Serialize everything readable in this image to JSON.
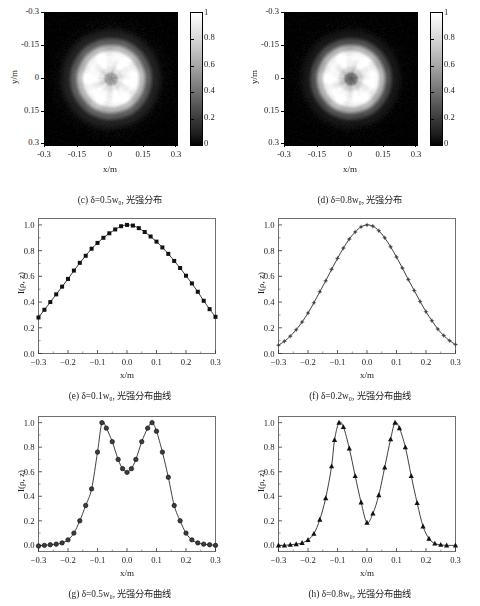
{
  "figure": {
    "colormap": "grayscale",
    "accent": "#000000",
    "frame_color": "#6f6f6f"
  },
  "axes_common": {
    "image_xlabel": "x/m",
    "image_ylabel": "y/m",
    "image_xticks": [
      "-0.3",
      "-0.15",
      "0",
      "0.15",
      "0.3"
    ],
    "image_yticks": [
      "-0.3",
      "-0.15",
      "0",
      "0.15",
      "0.3"
    ],
    "colorbar_ticks": [
      "0",
      "0.2",
      "0.4",
      "0.6",
      "0.8",
      "1"
    ],
    "plot_xlabel": "x/m",
    "plot_ylabel": "I(ρ, z)",
    "plot_xticks": [
      "-0.3",
      "-0.2",
      "-0.1",
      "0.0",
      "0.1",
      "0.2",
      "0.3"
    ],
    "plot_yticks": [
      "0.0",
      "0.2",
      "0.4",
      "0.6",
      "0.8",
      "1.0"
    ]
  },
  "panels": [
    {
      "id": "c",
      "caption": "(c) δ=0.5w₀, 光强分布",
      "kind": "image"
    },
    {
      "id": "d",
      "caption": "(d) δ=0.8w₀, 光强分布",
      "kind": "image"
    },
    {
      "id": "e",
      "caption": "(e) δ=0.1w₀, 光强分布曲线",
      "kind": "plot"
    },
    {
      "id": "f",
      "caption": "(f) δ=0.2w₀, 光强分布曲线",
      "kind": "plot"
    },
    {
      "id": "g",
      "caption": "(g) δ=0.5w₀, 光强分布曲线",
      "kind": "plot"
    },
    {
      "id": "h",
      "caption": "(h) δ=0.8w₀, 光强分布曲线",
      "kind": "plot"
    }
  ],
  "chart_data": [
    {
      "id": "c",
      "type": "heatmap",
      "title": "(c) δ=0.5w₀, 光强分布",
      "xlabel": "x/m",
      "ylabel": "y/m",
      "xlim": [
        -0.3,
        0.3
      ],
      "ylim": [
        -0.3,
        0.3
      ],
      "xticks": [
        -0.3,
        -0.15,
        0,
        0.15,
        0.3
      ],
      "yticks": [
        -0.3,
        -0.15,
        0,
        0.15,
        0.3
      ],
      "colormap": "gray",
      "clim": [
        0,
        1
      ],
      "colorbar_ticks": [
        0,
        0.2,
        0.4,
        0.6,
        0.8,
        1
      ],
      "description": "Near-flat-top circular beam spot, bright disc radius ~0.115 m with a small dark core at the centre (r~0.02 m) and a soft Gaussian fall-off to black background.",
      "profile_radius_m": [
        0.0,
        0.02,
        0.04,
        0.07,
        0.1,
        0.115,
        0.14,
        0.17,
        0.2,
        0.25,
        0.3
      ],
      "profile_intensity": [
        0.55,
        0.62,
        0.88,
        0.97,
        1.0,
        0.97,
        0.72,
        0.36,
        0.13,
        0.02,
        0.0
      ]
    },
    {
      "id": "d",
      "type": "heatmap",
      "title": "(d) δ=0.8w₀, 光强分布",
      "xlabel": "x/m",
      "ylabel": "y/m",
      "xlim": [
        -0.3,
        0.3
      ],
      "ylim": [
        -0.3,
        0.3
      ],
      "xticks": [
        -0.3,
        -0.15,
        0,
        0.15,
        0.3
      ],
      "yticks": [
        -0.3,
        -0.15,
        0,
        0.15,
        0.3
      ],
      "colormap": "gray",
      "clim": [
        0,
        1
      ],
      "colorbar_ticks": [
        0,
        0.2,
        0.4,
        0.6,
        0.8,
        1
      ],
      "description": "Annular (doughnut) beam spot: bright ring peaking at r~0.10 m with a clearly darker central core and sharper outer edge than panel (c).",
      "profile_radius_m": [
        0.0,
        0.02,
        0.04,
        0.07,
        0.1,
        0.115,
        0.14,
        0.17,
        0.2,
        0.25,
        0.3
      ],
      "profile_intensity": [
        0.35,
        0.45,
        0.8,
        0.96,
        1.0,
        0.96,
        0.7,
        0.3,
        0.09,
        0.01,
        0.0
      ]
    },
    {
      "id": "e",
      "type": "line",
      "title": "(e) δ=0.1w₀, 光强分布曲线",
      "xlabel": "x/m",
      "ylabel": "I(ρ, z)",
      "xlim": [
        -0.3,
        0.3
      ],
      "ylim": [
        0.0,
        1.05
      ],
      "xticks": [
        -0.3,
        -0.2,
        -0.1,
        0.0,
        0.1,
        0.2,
        0.3
      ],
      "yticks": [
        0.0,
        0.2,
        0.4,
        0.6,
        0.8,
        1.0
      ],
      "marker": "filled-square",
      "series": [
        {
          "name": "I(ρ, z)",
          "x": [
            -0.3,
            -0.28,
            -0.26,
            -0.24,
            -0.22,
            -0.2,
            -0.18,
            -0.16,
            -0.14,
            -0.12,
            -0.1,
            -0.08,
            -0.06,
            -0.04,
            -0.02,
            0.0,
            0.02,
            0.04,
            0.06,
            0.08,
            0.1,
            0.12,
            0.14,
            0.16,
            0.18,
            0.2,
            0.22,
            0.24,
            0.26,
            0.28,
            0.3
          ],
          "values": [
            0.28,
            0.34,
            0.4,
            0.46,
            0.52,
            0.58,
            0.645,
            0.705,
            0.76,
            0.815,
            0.86,
            0.9,
            0.935,
            0.965,
            0.99,
            1.0,
            0.995,
            0.975,
            0.945,
            0.91,
            0.87,
            0.825,
            0.775,
            0.72,
            0.665,
            0.605,
            0.545,
            0.48,
            0.41,
            0.345,
            0.285
          ]
        }
      ]
    },
    {
      "id": "f",
      "type": "line",
      "title": "(f) δ=0.2w₀, 光强分布曲线",
      "xlabel": "x/m",
      "ylabel": "I(ρ, z)",
      "xlim": [
        -0.3,
        0.3
      ],
      "ylim": [
        0.0,
        1.05
      ],
      "xticks": [
        -0.3,
        -0.2,
        -0.1,
        0.0,
        0.1,
        0.2,
        0.3
      ],
      "yticks": [
        0.0,
        0.2,
        0.4,
        0.6,
        0.8,
        1.0
      ],
      "marker": "small-star",
      "series": [
        {
          "name": "I(ρ, z)",
          "x": [
            -0.3,
            -0.28,
            -0.26,
            -0.24,
            -0.22,
            -0.2,
            -0.18,
            -0.16,
            -0.14,
            -0.12,
            -0.1,
            -0.08,
            -0.06,
            -0.04,
            -0.02,
            0.0,
            0.02,
            0.04,
            0.06,
            0.08,
            0.1,
            0.12,
            0.14,
            0.16,
            0.18,
            0.2,
            0.22,
            0.24,
            0.26,
            0.28,
            0.3
          ],
          "values": [
            0.065,
            0.095,
            0.135,
            0.185,
            0.245,
            0.315,
            0.395,
            0.48,
            0.565,
            0.655,
            0.74,
            0.82,
            0.89,
            0.945,
            0.985,
            1.0,
            0.99,
            0.955,
            0.9,
            0.83,
            0.75,
            0.665,
            0.575,
            0.49,
            0.405,
            0.325,
            0.255,
            0.19,
            0.14,
            0.1,
            0.07
          ]
        }
      ]
    },
    {
      "id": "g",
      "type": "line",
      "title": "(g) δ=0.5w₀, 光强分布曲线",
      "xlabel": "x/m",
      "ylabel": "I(ρ, z)",
      "xlim": [
        -0.3,
        0.3
      ],
      "ylim": [
        -0.05,
        1.05
      ],
      "xticks": [
        -0.3,
        -0.2,
        -0.1,
        0.0,
        0.1,
        0.2,
        0.3
      ],
      "yticks": [
        0.0,
        0.2,
        0.4,
        0.6,
        0.8,
        1.0
      ],
      "marker": "filled-circle",
      "peaks_x": [
        -0.085,
        0.085
      ],
      "central_dip": 0.595,
      "series": [
        {
          "name": "I(ρ, z)",
          "x": [
            -0.3,
            -0.28,
            -0.26,
            -0.24,
            -0.22,
            -0.2,
            -0.18,
            -0.16,
            -0.14,
            -0.12,
            -0.1,
            -0.085,
            -0.07,
            -0.05,
            -0.03,
            -0.015,
            0.0,
            0.015,
            0.03,
            0.05,
            0.07,
            0.085,
            0.1,
            0.12,
            0.14,
            0.16,
            0.18,
            0.2,
            0.22,
            0.24,
            0.26,
            0.28,
            0.3
          ],
          "values": [
            -0.005,
            0.0,
            0.005,
            0.01,
            0.02,
            0.045,
            0.1,
            0.2,
            0.325,
            0.46,
            0.76,
            1.0,
            0.955,
            0.845,
            0.7,
            0.625,
            0.595,
            0.625,
            0.7,
            0.845,
            0.955,
            1.0,
            0.93,
            0.76,
            0.555,
            0.325,
            0.2,
            0.1,
            0.045,
            0.02,
            0.01,
            0.005,
            0.0
          ]
        }
      ]
    },
    {
      "id": "h",
      "type": "line",
      "title": "(h) δ=0.8w₀, 光强分布曲线",
      "xlabel": "x/m",
      "ylabel": "I(ρ, z)",
      "xlim": [
        -0.3,
        0.3
      ],
      "ylim": [
        -0.05,
        1.05
      ],
      "xticks": [
        -0.3,
        -0.2,
        -0.1,
        0.0,
        0.1,
        0.2,
        0.3
      ],
      "yticks": [
        0.0,
        0.2,
        0.4,
        0.6,
        0.8,
        1.0
      ],
      "marker": "filled-triangle",
      "peaks_x": [
        -0.095,
        0.095
      ],
      "central_dip": 0.18,
      "series": [
        {
          "name": "I(ρ, z)",
          "x": [
            -0.3,
            -0.28,
            -0.26,
            -0.24,
            -0.22,
            -0.2,
            -0.18,
            -0.16,
            -0.14,
            -0.12,
            -0.11,
            -0.095,
            -0.08,
            -0.06,
            -0.04,
            -0.02,
            0.0,
            0.02,
            0.04,
            0.06,
            0.08,
            0.095,
            0.11,
            0.13,
            0.15,
            0.17,
            0.19,
            0.21,
            0.23,
            0.25,
            0.27,
            0.3
          ],
          "values": [
            0.0,
            0.0,
            0.005,
            0.01,
            0.02,
            0.045,
            0.095,
            0.21,
            0.385,
            0.645,
            0.86,
            1.0,
            0.965,
            0.79,
            0.565,
            0.35,
            0.185,
            0.26,
            0.41,
            0.635,
            0.865,
            1.0,
            0.955,
            0.8,
            0.565,
            0.345,
            0.155,
            0.055,
            0.015,
            0.005,
            0.0,
            0.0
          ]
        }
      ]
    }
  ]
}
